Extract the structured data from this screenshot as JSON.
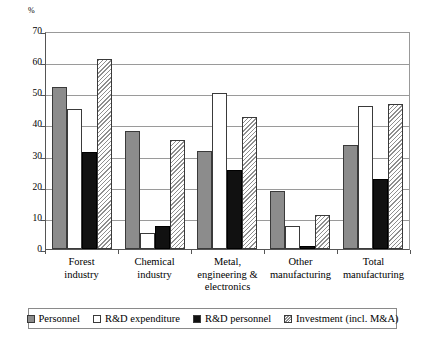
{
  "chart_data": {
    "type": "bar",
    "title": "",
    "xlabel": "",
    "ylabel": "%",
    "ylim": [
      0,
      70
    ],
    "yticks": [
      0,
      10,
      20,
      30,
      40,
      50,
      60,
      70
    ],
    "grid": true,
    "legend_position": "bottom",
    "categories": [
      "Forest industry",
      "Chemical industry",
      "Metal, engineering & electronics",
      "Other manufacturing",
      "Total manufacturing"
    ],
    "series": [
      {
        "name": "Personnel",
        "values": [
          52,
          38,
          31.5,
          18.5,
          33.5
        ]
      },
      {
        "name": "R&D expenditure",
        "values": [
          45,
          5,
          50,
          7.5,
          46
        ]
      },
      {
        "name": "R&D personnel",
        "values": [
          31,
          7.5,
          25.5,
          1,
          22.5
        ]
      },
      {
        "name": "Investment (incl. M&A)",
        "values": [
          61,
          35,
          42.5,
          11,
          46.5
        ]
      }
    ]
  },
  "axis": {
    "unit": "%",
    "tick_labels": [
      "70",
      "60",
      "50",
      "40",
      "30",
      "20",
      "10",
      "0"
    ]
  },
  "categories": [
    {
      "line1": "Forest",
      "line2": "industry",
      "line3": ""
    },
    {
      "line1": "Chemical",
      "line2": "industry",
      "line3": ""
    },
    {
      "line1": "Metal,",
      "line2": "engineering &",
      "line3": "electronics"
    },
    {
      "line1": "Other",
      "line2": "manufacturing",
      "line3": ""
    },
    {
      "line1": "Total",
      "line2": "manufacturing",
      "line3": ""
    }
  ],
  "legend": {
    "items": [
      {
        "label": "Personnel",
        "swatch": "solid-grey-swatch"
      },
      {
        "label": "R&D expenditure",
        "swatch": "white-swatch"
      },
      {
        "label": "R&D personnel",
        "swatch": "solid-black-swatch"
      },
      {
        "label": "Investment (incl. M&A)",
        "swatch": "hatched-swatch"
      }
    ]
  },
  "colors": {
    "personnel": "#8c8c8c",
    "rd_expenditure": "#ffffff",
    "rd_personnel": "#111111",
    "investment": "#8f8f8f",
    "axis": "#555555",
    "grid": "#9a9a9a"
  }
}
